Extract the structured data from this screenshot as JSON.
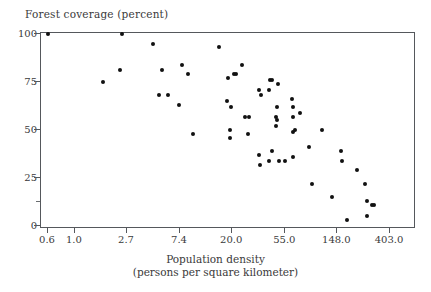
{
  "chart_data": {
    "type": "scatter",
    "title": "",
    "ylabel": "Forest coverage (percent)",
    "xlabel": "Population density",
    "xlabel_sub": "(persons per square kilometer)",
    "xscale": "log",
    "xticks": [
      "0.6",
      "1.0",
      "2.7",
      "7.4",
      "20.0",
      "55.0",
      "148.0",
      "403.0"
    ],
    "xtick_values": [
      0.6,
      1.0,
      2.7,
      7.4,
      20.0,
      55.0,
      148.0,
      403.0
    ],
    "yticks": [
      "0",
      "25",
      "50",
      "75",
      "100"
    ],
    "ytick_values": [
      0,
      25,
      50,
      75,
      100
    ],
    "ylim": [
      0,
      104
    ],
    "xlim": [
      0.48,
      560
    ],
    "grid": false,
    "legend": null,
    "marker": "filled-circle",
    "marker_color": "#111111",
    "frame_color": "#55585c",
    "points": [
      [
        0.6,
        100
      ],
      [
        2.45,
        100
      ],
      [
        1.7,
        75
      ],
      [
        2.35,
        81
      ],
      [
        4.4,
        95
      ],
      [
        5.3,
        81
      ],
      [
        5.0,
        68
      ],
      [
        5.9,
        68
      ],
      [
        7.7,
        84
      ],
      [
        8.6,
        79
      ],
      [
        7.2,
        63
      ],
      [
        9.4,
        48
      ],
      [
        15.5,
        93
      ],
      [
        18.5,
        77
      ],
      [
        18.0,
        65
      ],
      [
        19.5,
        62
      ],
      [
        20.5,
        79
      ],
      [
        21.5,
        79
      ],
      [
        19.0,
        50
      ],
      [
        19.3,
        46
      ],
      [
        24.0,
        84
      ],
      [
        25.5,
        57
      ],
      [
        27.5,
        57
      ],
      [
        27.0,
        48
      ],
      [
        33.0,
        71
      ],
      [
        34.5,
        68
      ],
      [
        33.5,
        37
      ],
      [
        34.0,
        32
      ],
      [
        41.0,
        76
      ],
      [
        43.0,
        76
      ],
      [
        40.0,
        71
      ],
      [
        40.5,
        34
      ],
      [
        42.5,
        39
      ],
      [
        48.0,
        74
      ],
      [
        47.0,
        62
      ],
      [
        46.0,
        57
      ],
      [
        46.5,
        55
      ],
      [
        46.0,
        52
      ],
      [
        48.5,
        34
      ],
      [
        55.0,
        34
      ],
      [
        62.0,
        66
      ],
      [
        63.5,
        62
      ],
      [
        64.0,
        57
      ],
      [
        63.0,
        49
      ],
      [
        66.0,
        50
      ],
      [
        63.0,
        36
      ],
      [
        72.0,
        59
      ],
      [
        86.0,
        41
      ],
      [
        92.0,
        22
      ],
      [
        110.0,
        50
      ],
      [
        133.0,
        15
      ],
      [
        160.0,
        39
      ],
      [
        163.0,
        34
      ],
      [
        177.0,
        3
      ],
      [
        215.0,
        29
      ],
      [
        250.0,
        22
      ],
      [
        260.0,
        13
      ],
      [
        285.0,
        11
      ],
      [
        295.0,
        11
      ],
      [
        262.0,
        5
      ]
    ]
  },
  "axis_titles": {
    "y_top": "Forest coverage (percent)",
    "x_line1": "Population density",
    "x_line2": "(persons per square kilometer)"
  }
}
